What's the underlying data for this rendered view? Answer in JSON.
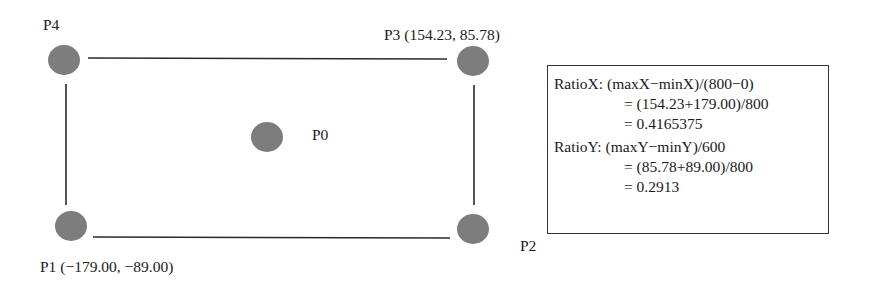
{
  "diagram": {
    "colors": {
      "point": "#7d7d7d",
      "line": "#2a2a2a",
      "text": "#1a1a1a"
    },
    "points": [
      {
        "id": "P0",
        "label": "P0"
      },
      {
        "id": "P1",
        "label": "P1 (−179.00, −89.00)"
      },
      {
        "id": "P2",
        "label": "P2"
      },
      {
        "id": "P3",
        "label": "P3 (154.23, 85.78)"
      },
      {
        "id": "P4",
        "label": "P4"
      }
    ],
    "formula": {
      "ratio_x": {
        "label": "RatioX:",
        "line1": "(maxX−minX)/(800−0)",
        "line2": "= (154.23+179.00)/800",
        "line3": "= 0.4165375"
      },
      "ratio_y": {
        "label": "RatioY:",
        "line1": "(maxY−minY)/600",
        "line2": "= (85.78+89.00)/800",
        "line3": "= 0.2913"
      }
    }
  }
}
